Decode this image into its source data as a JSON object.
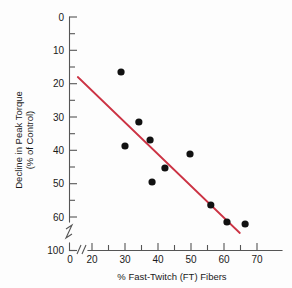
{
  "chart_data": {
    "type": "scatter",
    "title": "",
    "xlabel": "% Fast-Twitch (FT) Fibers",
    "ylabel_line1": "Decline in Peak Torque",
    "ylabel_line2": "(% of Control)",
    "xlim": [
      15,
      73
    ],
    "ylim": [
      0,
      100
    ],
    "y_axis_inverted": true,
    "y_axis_break": {
      "between": [
        60,
        100
      ],
      "present": true
    },
    "x_axis_break": {
      "between": [
        0,
        15
      ],
      "present": true
    },
    "grid": false,
    "legend": null,
    "x_ticks": [
      20,
      30,
      40,
      50,
      60,
      70
    ],
    "x_tick_labels": [
      "20",
      "30",
      "40",
      "50",
      "60",
      "70"
    ],
    "x_minor_ticks": [
      25,
      35,
      45,
      55,
      65
    ],
    "x_origin_label": "0",
    "y_ticks": [
      0,
      10,
      20,
      30,
      40,
      50,
      60,
      100
    ],
    "y_tick_labels": [
      "0",
      "10",
      "20",
      "30",
      "40",
      "50",
      "60",
      "100"
    ],
    "y_minor_ticks": [
      5,
      15,
      25,
      35,
      45,
      55
    ],
    "points": [
      {
        "x": 28.8,
        "y": 16.5
      },
      {
        "x": 30.0,
        "y": 38.7
      },
      {
        "x": 34.2,
        "y": 31.5
      },
      {
        "x": 37.6,
        "y": 36.9
      },
      {
        "x": 38.2,
        "y": 49.5
      },
      {
        "x": 42.1,
        "y": 45.3
      },
      {
        "x": 49.7,
        "y": 41.1
      },
      {
        "x": 56.0,
        "y": 56.4
      },
      {
        "x": 60.9,
        "y": 61.5
      },
      {
        "x": 66.4,
        "y": 62.1
      }
    ],
    "point_color": "#111111",
    "trendline": {
      "type": "linear-fit",
      "x_start": 15.7,
      "y_start": 18.0,
      "x_end": 64.8,
      "y_end": 64.8,
      "color": "#cc3344"
    },
    "axis_color": "#555555"
  }
}
